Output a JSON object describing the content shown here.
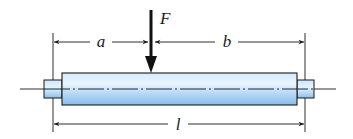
{
  "diagram": {
    "type": "beam-with-point-load",
    "labels": {
      "force": "F",
      "left_distance": "a",
      "right_distance": "b",
      "total_length": "l"
    },
    "colors": {
      "shaft_light": "#e6f3fd",
      "shaft_mid": "#bfe0f8",
      "shaft_dark": "#7fb7ea",
      "outline": "#1a1a1a",
      "background": "#ffffff"
    }
  }
}
